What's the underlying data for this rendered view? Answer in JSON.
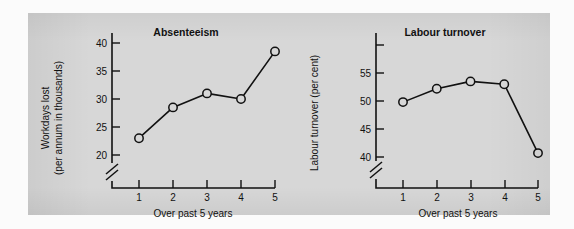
{
  "figure": {
    "background_color": "#d7d7d7",
    "line_color": "#111111",
    "marker_style": "open-circle"
  },
  "chart_data": [
    {
      "type": "line",
      "title": "Absenteeism",
      "xlabel": "Over past 5 years",
      "ylabel": "Workdays lost\n(per annum in thousands)",
      "ylabel_line1": "Workdays lost",
      "ylabel_line2": "(per annum in thousands)",
      "categories": [
        "1",
        "2",
        "3",
        "4",
        "5"
      ],
      "x": [
        1,
        2,
        3,
        4,
        5
      ],
      "values": [
        23,
        28.5,
        31,
        30,
        38.5
      ],
      "xtick_labels": [
        "1",
        "2",
        "3",
        "4",
        "5"
      ],
      "ytick_labels": [
        "20",
        "25",
        "30",
        "35",
        "40"
      ],
      "yticks": [
        20,
        25,
        30,
        35,
        40
      ],
      "ylim": [
        20,
        42
      ],
      "xlim": [
        0.5,
        5.5
      ],
      "axis_break": true,
      "axis_break_axis": "y",
      "grid": false,
      "legend": false
    },
    {
      "type": "line",
      "title": "Labour turnover",
      "xlabel": "Over past 5 years",
      "ylabel": "Labour turnover (per cent)",
      "categories": [
        "1",
        "2",
        "3",
        "4",
        "5"
      ],
      "x": [
        1,
        2,
        3,
        4,
        5
      ],
      "values": [
        49.8,
        52.2,
        53.5,
        53.0,
        40.7
      ],
      "xtick_labels": [
        "1",
        "2",
        "3",
        "4",
        "5"
      ],
      "ytick_labels": [
        "40",
        "45",
        "50",
        "55",
        ""
      ],
      "yticks": [
        40,
        45,
        50,
        55,
        60
      ],
      "ylim": [
        40,
        61
      ],
      "xlim": [
        0.5,
        5.5
      ],
      "axis_break": true,
      "axis_break_axis": "y",
      "grid": false,
      "legend": false
    }
  ]
}
